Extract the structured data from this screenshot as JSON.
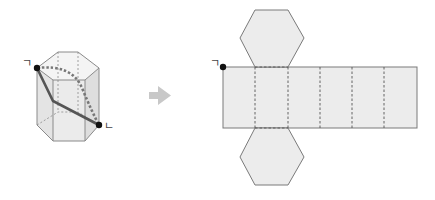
{
  "figure": {
    "labels": {
      "start_point": "ㄱ",
      "end_point": "ㄴ",
      "net_start_point": "ㄱ"
    },
    "arrow": "right-arrow",
    "colors": {
      "face_fill": "#ececec",
      "edge": "#7a7a7a",
      "path_solid": "#555555",
      "path_dotted": "#777777",
      "arrow": "#c8c8c8",
      "point": "#111111"
    },
    "net": {
      "lateral_faces": 6,
      "hexagon_faces": 2
    }
  }
}
